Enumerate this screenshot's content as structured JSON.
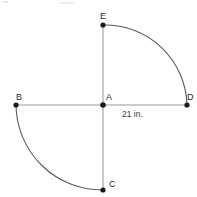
{
  "diagram": {
    "type": "geometry-figure",
    "canvas": {
      "width": 197,
      "height": 197,
      "background": "#ffffff"
    },
    "colors": {
      "segment": "#9a9a9a",
      "arc": "#5a5a5a",
      "point": "#1a1a1a",
      "label": "#2b2b2b",
      "measure": "#3a3a3a"
    },
    "points": [
      {
        "id": "E",
        "label": "E",
        "x": 103,
        "y": 25,
        "label_x": 100,
        "label_y": 12
      },
      {
        "id": "A",
        "label": "A",
        "x": 103,
        "y": 105,
        "label_x": 106,
        "label_y": 93
      },
      {
        "id": "B",
        "label": "B",
        "x": 16,
        "y": 105,
        "label_x": 16,
        "label_y": 93
      },
      {
        "id": "D",
        "label": "D",
        "x": 187,
        "y": 105,
        "label_x": 187,
        "label_y": 93
      },
      {
        "id": "C",
        "label": "C",
        "x": 103,
        "y": 190,
        "label_x": 109,
        "label_y": 180
      }
    ],
    "segments": [
      {
        "id": "BD",
        "from": "B",
        "to": "D",
        "x1": 16,
        "y1": 105,
        "x2": 187,
        "y2": 105
      },
      {
        "id": "EC",
        "from": "E",
        "to": "C",
        "x1": 103,
        "y1": 25,
        "x2": 103,
        "y2": 190
      }
    ],
    "arcs": [
      {
        "id": "arc-ED",
        "from": "E",
        "to": "D",
        "center": "A",
        "radius": 82,
        "quadrant": "upper-right",
        "path": "M 103 25 A 82 82 0 0 1 187 105"
      },
      {
        "id": "arc-BC",
        "from": "B",
        "to": "C",
        "center": "A",
        "radius": 86,
        "quadrant": "lower-left",
        "path": "M 16 105 A 86 86 0 0 0 103 190"
      }
    ],
    "measurements": [
      {
        "id": "AD-length",
        "text": "21 in.",
        "value": 21,
        "unit": "in.",
        "x": 122,
        "y": 110
      }
    ]
  }
}
